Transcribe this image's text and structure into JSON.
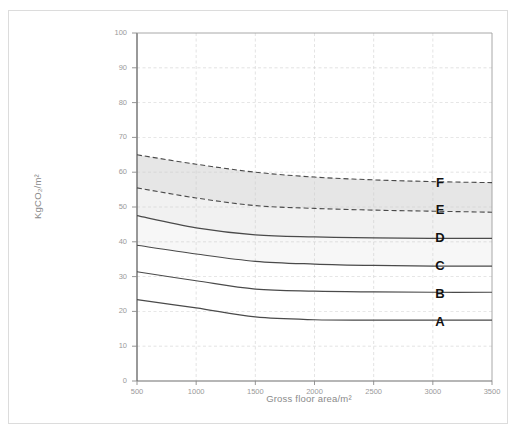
{
  "figure": {
    "title": "",
    "frame_color": "#dcdcdc",
    "background": "#ffffff"
  },
  "axes": {
    "x_title": "Gross floor area/m²",
    "y_title": "KgCO₂/m²",
    "x_ticks": [
      "500",
      "1000",
      "1500",
      "2000",
      "2500",
      "3000",
      "3500"
    ],
    "y_ticks": [
      "0",
      "10",
      "20",
      "30",
      "40",
      "50",
      "60",
      "70",
      "80",
      "90",
      "100"
    ],
    "tick_color": "#9a9a9a",
    "grid_color": "#cccccc",
    "axis_color": "#808080"
  },
  "bands": {
    "labels": [
      "A",
      "B",
      "C",
      "D",
      "E",
      "F"
    ],
    "fills": [
      "#ffffff",
      "#ffffff",
      "#ffffff",
      "#f7f7f7",
      "#f1f1f1",
      "#e6e6e6"
    ],
    "label_positions_y": [
      17,
      25,
      33,
      41,
      49,
      57
    ]
  },
  "chart_data": {
    "type": "line",
    "title": "",
    "xlabel": "Gross floor area/m²",
    "ylabel": "KgCO₂/m²",
    "xlim": [
      500,
      3500
    ],
    "ylim": [
      0,
      100
    ],
    "grid": true,
    "legend": "none",
    "annotations": [
      "A",
      "B",
      "C",
      "D",
      "E",
      "F"
    ],
    "x": [
      500,
      1000,
      1500,
      2000,
      2500,
      3000,
      3500
    ],
    "series": [
      {
        "name": "F upper boundary",
        "style": "dashed",
        "values": [
          65.0,
          62.3,
          60.0,
          58.6,
          57.8,
          57.3,
          57.0
        ]
      },
      {
        "name": "E/F boundary",
        "style": "dashed",
        "values": [
          55.5,
          52.6,
          50.4,
          49.6,
          49.1,
          48.8,
          48.5
        ]
      },
      {
        "name": "D/E boundary",
        "style": "solid",
        "values": [
          47.5,
          44.0,
          42.0,
          41.4,
          41.1,
          41.0,
          41.0
        ]
      },
      {
        "name": "C/D boundary",
        "style": "solid",
        "values": [
          39.0,
          36.5,
          34.4,
          33.6,
          33.2,
          33.0,
          33.0
        ]
      },
      {
        "name": "B/C boundary",
        "style": "solid",
        "values": [
          31.4,
          28.8,
          26.4,
          25.8,
          25.6,
          25.5,
          25.5
        ]
      },
      {
        "name": "A/B boundary",
        "style": "solid",
        "values": [
          23.4,
          21.0,
          18.4,
          17.6,
          17.5,
          17.5,
          17.5
        ]
      }
    ]
  }
}
